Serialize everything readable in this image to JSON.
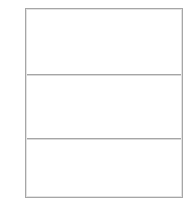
{
  "canvas": {
    "width": 191,
    "height": 204,
    "background_color": "#ffffff"
  },
  "table": {
    "name": "empty-three-row-table",
    "border_color": "#a6a6a6",
    "inner_line_color": "#e2e2e2",
    "divider_color": "#a6a6a6",
    "cell_background": "#ffffff",
    "row_count": 3,
    "column_count": 1,
    "rows": [
      {
        "id": "row-1",
        "cells": [
          {
            "text": ""
          }
        ]
      },
      {
        "id": "row-2",
        "cells": [
          {
            "text": ""
          }
        ]
      },
      {
        "id": "row-3",
        "cells": [
          {
            "text": ""
          }
        ]
      }
    ]
  }
}
